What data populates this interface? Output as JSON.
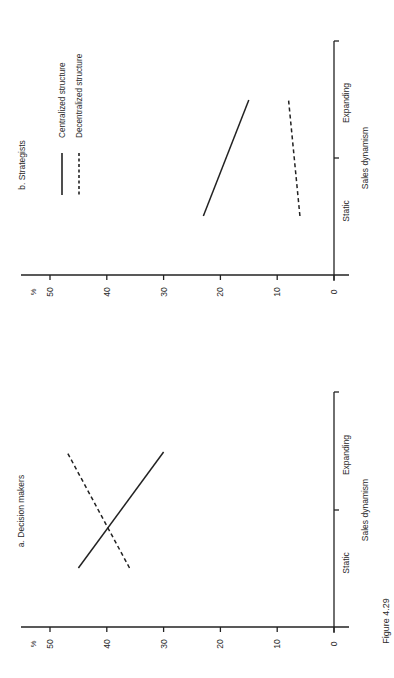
{
  "figure": {
    "label": "Figure 4.29",
    "orientation": "rotated 90° counter-clockwise (value axis runs horizontally, category axis vertically)"
  },
  "chart_data": [
    {
      "type": "line",
      "title": "a. Decision makers",
      "xlabel": "Sales dynamism",
      "ylabel": "%",
      "categories": [
        "Static",
        "Expanding"
      ],
      "yticks": [
        0,
        10,
        20,
        30,
        40,
        50
      ],
      "ylim": [
        0,
        55
      ],
      "grid": false,
      "series": [
        {
          "name": "Centralized structure",
          "style": "solid",
          "values": [
            45,
            30
          ]
        },
        {
          "name": "Decentralized structure",
          "style": "dashed",
          "values": [
            36,
            47
          ]
        }
      ]
    },
    {
      "type": "line",
      "title": "b. Strategists",
      "xlabel": "Sales dynamism",
      "ylabel": "%",
      "categories": [
        "Static",
        "Expanding"
      ],
      "yticks": [
        0,
        10,
        20,
        30,
        40,
        50
      ],
      "ylim": [
        0,
        55
      ],
      "grid": false,
      "legend": {
        "position": "top-left (rotated)",
        "entries": [
          {
            "label": "Centralized structure",
            "style": "solid"
          },
          {
            "label": "Decentralized structure",
            "style": "dashed"
          }
        ]
      },
      "series": [
        {
          "name": "Centralized structure",
          "style": "solid",
          "values": [
            23,
            15
          ]
        },
        {
          "name": "Decentralized structure",
          "style": "dashed",
          "values": [
            6,
            8
          ]
        }
      ]
    }
  ],
  "colors": {
    "ink": "#222222",
    "background": "#ffffff"
  }
}
